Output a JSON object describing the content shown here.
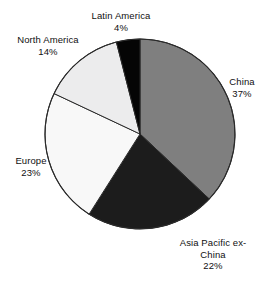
{
  "chart_data": {
    "type": "pie",
    "title": "",
    "categories": [
      "China",
      "Asia Pacific ex-China",
      "Europe",
      "North America",
      "Latin America"
    ],
    "values": [
      37,
      22,
      23,
      14,
      4
    ],
    "value_unit": "%",
    "start_angle_deg": 0,
    "direction": "clockwise",
    "legend": "none",
    "labels_position": "outside",
    "colors": [
      "#7f7f7f",
      "#1c1c1c",
      "#f8f8f8",
      "#ececed",
      "#050505"
    ],
    "slices": [
      {
        "name": "China",
        "value": 37,
        "value_label": "37%",
        "color": "#7f7f7f"
      },
      {
        "name": "Asia Pacific ex-China",
        "value": 22,
        "value_label": "22%",
        "color": "#1c1c1c"
      },
      {
        "name": "Europe",
        "value": 23,
        "value_label": "23%",
        "color": "#f8f8f8"
      },
      {
        "name": "North America",
        "value": 14,
        "value_label": "14%",
        "color": "#ececed"
      },
      {
        "name": "Latin America",
        "value": 4,
        "value_label": "4%",
        "color": "#050505"
      }
    ]
  },
  "labels": {
    "latin_america": {
      "name": "Latin America",
      "pct": "4%"
    },
    "north_america": {
      "name": "North America",
      "pct": "14%"
    },
    "china": {
      "name": "China",
      "pct": "37%"
    },
    "europe": {
      "name": "Europe",
      "pct": "23%"
    },
    "asia_pacific": {
      "line1": "Asia Pacific ex-",
      "line2": "China",
      "pct": "22%"
    }
  },
  "style": {
    "outline_color": "#2b2b2b",
    "background": "#ffffff"
  }
}
